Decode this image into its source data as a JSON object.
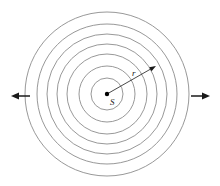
{
  "figure": {
    "background_color": "#ffffff",
    "wave_color": "#8c8c8c",
    "arrow_color": "#1a1a1a",
    "label_color": "#1a1a1a",
    "source_dot_color": "#000000",
    "width": 220,
    "height": 186
  },
  "source": {
    "label": "S",
    "center_x": 107,
    "center_y": 94,
    "dot_radius": 2.2
  },
  "radius_vector": {
    "label": "r",
    "label_x": 132,
    "label_y": 69,
    "start_x": 107,
    "start_y": 94,
    "end_x": 156,
    "end_y": 66
  },
  "wavefronts": {
    "count": 7,
    "stroke_width": 0.9,
    "circles": [
      {
        "name": "wavefront-1",
        "radius": 16
      },
      {
        "name": "wavefront-2",
        "radius": 28
      },
      {
        "name": "wavefront-3",
        "radius": 40
      },
      {
        "name": "wavefront-4",
        "radius": 50
      },
      {
        "name": "wavefront-5",
        "radius": 60
      },
      {
        "name": "wavefront-6",
        "radius": 70
      },
      {
        "name": "wavefront-7",
        "radius": 82
      }
    ]
  },
  "propagation_arrows": [
    {
      "name": "left-propagation-arrow",
      "direction": "left",
      "tail_x": 30,
      "tail_y": 96,
      "head_x": 11,
      "head_y": 96
    },
    {
      "name": "right-propagation-arrow",
      "direction": "right",
      "tail_x": 191,
      "tail_y": 96,
      "head_x": 210,
      "head_y": 96
    }
  ]
}
